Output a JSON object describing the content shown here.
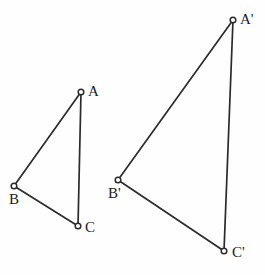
{
  "figure": {
    "background_color": "#fefefe",
    "stroke_color": "#2b2b2b",
    "vertex_fill_color": "#ffffff",
    "label_color": "#1c1c1c",
    "width": 265,
    "height": 275
  },
  "chart_data": {
    "type": "diagram",
    "title": "",
    "xlabel": "",
    "ylabel": "",
    "grid": false,
    "legend": null,
    "shapes": [
      {
        "name": "triangle-abc",
        "kind": "triangle",
        "closed": true,
        "vertices": [
          {
            "label": "A",
            "x": 81,
            "y": 92
          },
          {
            "label": "B",
            "x": 14,
            "y": 186
          },
          {
            "label": "C",
            "x": 78,
            "y": 226
          }
        ],
        "edges": [
          {
            "from": "A",
            "to": "B"
          },
          {
            "from": "B",
            "to": "C"
          },
          {
            "from": "C",
            "to": "A"
          }
        ]
      },
      {
        "name": "triangle-a-prime-b-prime-c-prime",
        "kind": "triangle",
        "closed": true,
        "vertices": [
          {
            "label": "A'",
            "x": 233,
            "y": 20
          },
          {
            "label": "B'",
            "x": 118,
            "y": 180
          },
          {
            "label": "C'",
            "x": 224,
            "y": 251
          }
        ],
        "edges": [
          {
            "from": "A'",
            "to": "B'"
          },
          {
            "from": "B'",
            "to": "C'"
          },
          {
            "from": "C'",
            "to": "A'"
          }
        ]
      }
    ]
  },
  "labels": {
    "a": {
      "text": "A",
      "x": 88,
      "y": 84
    },
    "b": {
      "text": "B",
      "x": 9,
      "y": 192
    },
    "c": {
      "text": "C",
      "x": 85,
      "y": 220
    },
    "a_prime": {
      "text": "A'",
      "x": 240,
      "y": 12
    },
    "b_prime": {
      "text": "B'",
      "x": 108,
      "y": 186
    },
    "c_prime": {
      "text": "C'",
      "x": 232,
      "y": 245
    }
  },
  "vertex_marker": {
    "radius": 2.8,
    "style": "open-circle"
  }
}
